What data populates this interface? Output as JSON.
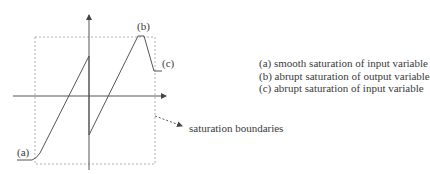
{
  "figure": {
    "labels": {
      "a": "(a)",
      "b": "(b)",
      "c": "(c)",
      "boundaries": "saturation boundaries"
    },
    "legend": [
      "(a) smooth saturation of input variable",
      "(b) abrupt saturation of output variable",
      "(c) abrupt saturation of input variable"
    ],
    "colors": {
      "curve": "#555555",
      "axes": "#555555",
      "boundary": "#b0b0b0",
      "text": "#3a3a3a"
    }
  }
}
